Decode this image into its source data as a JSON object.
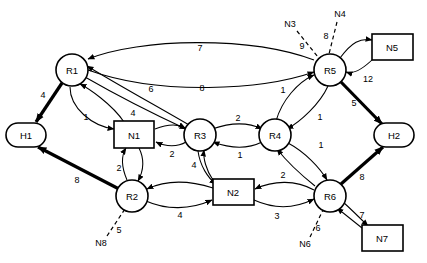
{
  "diagram": {
    "type": "directed-graph",
    "colors": {
      "stroke": "#000000",
      "fill": "#ffffff"
    },
    "routers": [
      {
        "id": "R1",
        "label": "R1",
        "shape": "circle",
        "x": 72,
        "y": 70
      },
      {
        "id": "R2",
        "label": "R2",
        "shape": "circle",
        "x": 132,
        "y": 196
      },
      {
        "id": "R3",
        "label": "R3",
        "shape": "circle",
        "x": 200,
        "y": 135
      },
      {
        "id": "R4",
        "label": "R4",
        "shape": "circle",
        "x": 275,
        "y": 135
      },
      {
        "id": "R5",
        "label": "R5",
        "shape": "circle",
        "x": 330,
        "y": 70
      },
      {
        "id": "R6",
        "label": "R6",
        "shape": "circle",
        "x": 330,
        "y": 196
      }
    ],
    "hosts": [
      {
        "id": "H1",
        "label": "H1",
        "shape": "rounded",
        "x": 26,
        "y": 135
      },
      {
        "id": "H2",
        "label": "H2",
        "shape": "rounded",
        "x": 394,
        "y": 135
      }
    ],
    "networks": [
      {
        "id": "N1",
        "label": "N1",
        "shape": "rect",
        "x": 134,
        "y": 135
      },
      {
        "id": "N2",
        "label": "N2",
        "shape": "rect",
        "x": 233,
        "y": 192
      },
      {
        "id": "N5",
        "label": "N5",
        "shape": "rect",
        "x": 392,
        "y": 47
      },
      {
        "id": "N7",
        "label": "N7",
        "shape": "rect",
        "x": 382,
        "y": 238
      }
    ],
    "external_networks": [
      {
        "id": "N3",
        "label": "N3",
        "x": 290,
        "y": 24,
        "cost": "9",
        "cost_x": 302,
        "cost_y": 46,
        "attaches_to": "R5"
      },
      {
        "id": "N4",
        "label": "N4",
        "x": 340,
        "y": 14,
        "cost": "8",
        "cost_x": 326,
        "cost_y": 36,
        "attaches_to": "R5"
      },
      {
        "id": "N8",
        "label": "N8",
        "x": 101,
        "y": 243,
        "cost": "5",
        "cost_x": 119,
        "cost_y": 230,
        "attaches_to": "R2"
      },
      {
        "id": "N6",
        "label": "N6",
        "x": 305,
        "y": 244,
        "cost": "6",
        "cost_x": 318,
        "cost_y": 228,
        "attaches_to": "R6"
      }
    ],
    "links": [
      {
        "from": "R5",
        "to": "R1",
        "cost": "7",
        "style": "thin",
        "label_x": 200,
        "label_y": 48
      },
      {
        "from": "R1",
        "to": "R5",
        "cost": "8",
        "style": "thin",
        "label_x": 202,
        "label_y": 88
      },
      {
        "from": "R3",
        "to": "R1",
        "cost": "6",
        "style": "thin",
        "label_x": 151,
        "label_y": 89
      },
      {
        "from": "R1",
        "to": "R3",
        "cost": "4",
        "style": "thin",
        "label_x": 133,
        "label_y": 113
      },
      {
        "from": "R1",
        "to": "N1",
        "cost": "1",
        "style": "thin",
        "label_x": 86,
        "label_y": 117
      },
      {
        "from": "R1",
        "to": "H1",
        "cost": "4",
        "style": "thick",
        "label_x": 43,
        "label_y": 95
      },
      {
        "from": "R2",
        "to": "H1",
        "cost": "8",
        "style": "thick",
        "label_x": 77,
        "label_y": 180
      },
      {
        "from": "N1",
        "to": "R2",
        "cost": "2",
        "style": "thin",
        "label_x": 119,
        "label_y": 168
      },
      {
        "from": "N1",
        "to": "R3",
        "cost": "2",
        "style": "thin",
        "label_x": 172,
        "label_y": 154
      },
      {
        "from": "R3",
        "to": "R4",
        "cost": "2",
        "style": "thin",
        "label_x": 238,
        "label_y": 120
      },
      {
        "from": "R4",
        "to": "R3",
        "cost": "1",
        "style": "thin",
        "label_x": 240,
        "label_y": 155
      },
      {
        "from": "R3",
        "to": "N2",
        "cost": "4",
        "style": "thin",
        "label_x": 196,
        "label_y": 165
      },
      {
        "from": "N2",
        "to": "R2",
        "cost": "4",
        "style": "thin",
        "label_x": 180,
        "label_y": 215
      },
      {
        "from": "N2",
        "to": "R6",
        "cost": "3",
        "style": "thin",
        "label_x": 277,
        "label_y": 216
      },
      {
        "from": "R4",
        "to": "R5",
        "cost": "1",
        "style": "thin",
        "label_x": 283,
        "label_y": 90
      },
      {
        "from": "R5",
        "to": "R4",
        "cost": "1",
        "style": "thin",
        "label_x": 320,
        "label_y": 117
      },
      {
        "from": "R4",
        "to": "R6",
        "cost": "1",
        "style": "thin",
        "label_x": 321,
        "label_y": 145
      },
      {
        "from": "R6",
        "to": "R4",
        "cost": "2",
        "style": "thin",
        "label_x": 283,
        "label_y": 175
      },
      {
        "from": "R5",
        "to": "N5",
        "cost": "",
        "style": "thin",
        "label_x": 0,
        "label_y": 0
      },
      {
        "from": "N5",
        "to": "R5",
        "cost": "12",
        "style": "thin",
        "label_x": 368,
        "label_y": 79
      },
      {
        "from": "R5",
        "to": "H2",
        "cost": "5",
        "style": "thick",
        "label_x": 354,
        "label_y": 103
      },
      {
        "from": "R6",
        "to": "H2",
        "cost": "8",
        "style": "thick",
        "label_x": 362,
        "label_y": 177
      },
      {
        "from": "R6",
        "to": "N7",
        "cost": "7",
        "style": "thin",
        "label_x": 362,
        "label_y": 215
      }
    ]
  }
}
